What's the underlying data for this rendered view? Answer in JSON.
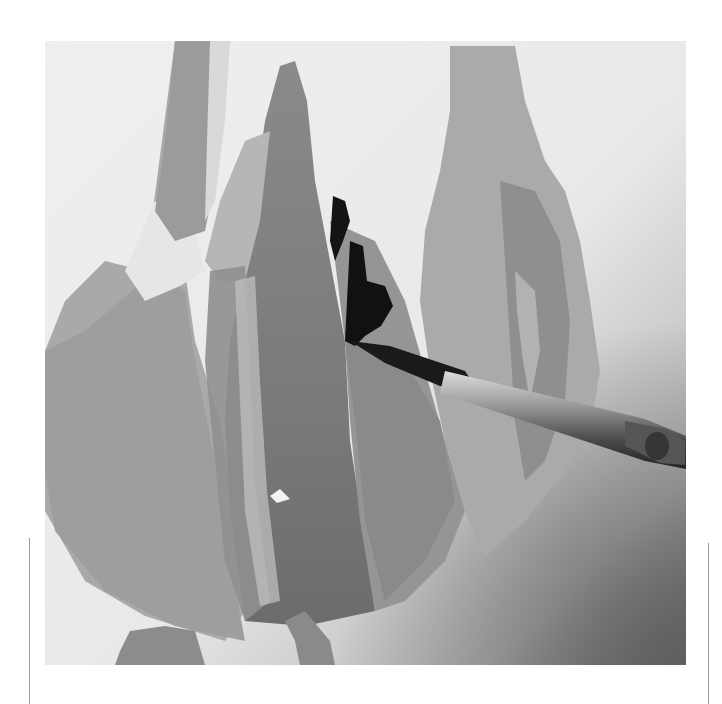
{
  "image": {
    "description": "Grayscale photograph of a watercolor tulip painting in progress with a paintbrush applying dark pigment",
    "palette": {
      "paper": "#ececec",
      "petal_light": "#b9b9b9",
      "petal_mid": "#9a9a9a",
      "petal_dark": "#7c7c7c",
      "ink": "#111111",
      "brush_ferrule": "#8e8e8e",
      "shadow": "#6a6a6a"
    }
  }
}
